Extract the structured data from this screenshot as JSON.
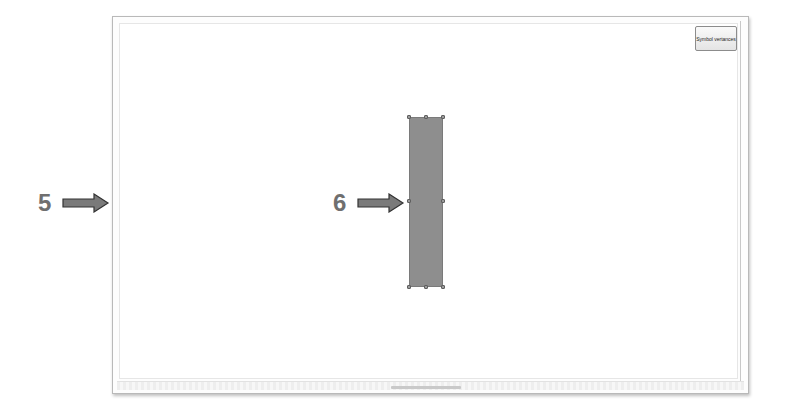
{
  "canvas": {
    "button_label": "Symbol vertances"
  },
  "shape": {
    "fill_color": "#8e8e8e",
    "selected": true
  },
  "annotations": [
    {
      "number": "5",
      "target": "canvas-left-edge"
    },
    {
      "number": "6",
      "target": "selected-shape"
    }
  ]
}
